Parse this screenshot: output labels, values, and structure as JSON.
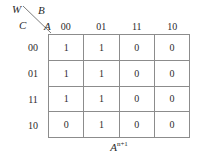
{
  "figure": {
    "type": "karnaugh-map",
    "corner": {
      "top_left_variable": "W",
      "top_right_variable": "B",
      "bottom_left_variable": "C",
      "bottom_right_variable": "A",
      "diagonal_icon": "diagonal-divider-line"
    },
    "column_headers": [
      "00",
      "01",
      "11",
      "10"
    ],
    "row_headers": [
      "00",
      "01",
      "11",
      "10"
    ],
    "rows": [
      {
        "label": "00",
        "cells": [
          "1",
          "1",
          "0",
          "0"
        ]
      },
      {
        "label": "01",
        "cells": [
          "1",
          "1",
          "0",
          "0"
        ]
      },
      {
        "label": "11",
        "cells": [
          "1",
          "1",
          "0",
          "0"
        ]
      },
      {
        "label": "10",
        "cells": [
          "0",
          "1",
          "0",
          "0"
        ]
      }
    ],
    "caption": {
      "base": "A",
      "superscript": "n+1"
    },
    "colors": {
      "grid_line": "#8c8c8c",
      "text": "#2b2b2b",
      "background": "#ffffff"
    }
  }
}
